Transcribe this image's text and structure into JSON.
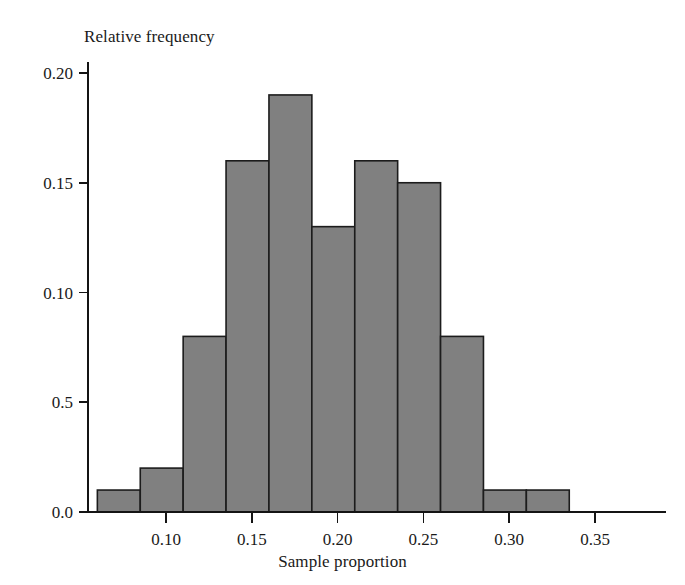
{
  "chart_data": {
    "type": "bar",
    "title": "",
    "xlabel": "Sample proportion",
    "ylabel": "Relative frequency",
    "xlim": [
      0.05,
      0.38
    ],
    "ylim": [
      0.0,
      0.205
    ],
    "grid": false,
    "legend": "none",
    "bin_width": 0.025,
    "bar_fill_color": "#808080",
    "bar_edge_color": "#1c1c1c",
    "axis_color": "#141414",
    "bin_edges": [
      0.06,
      0.085,
      0.11,
      0.135,
      0.16,
      0.185,
      0.21,
      0.235,
      0.26,
      0.285,
      0.31,
      0.335
    ],
    "categories": [
      "0.060-0.085",
      "0.085-0.110",
      "0.110-0.135",
      "0.135-0.160",
      "0.160-0.185",
      "0.185-0.210",
      "0.210-0.235",
      "0.235-0.260",
      "0.260-0.285",
      "0.285-0.310",
      "0.310-0.335"
    ],
    "values": [
      0.01,
      0.02,
      0.08,
      0.16,
      0.19,
      0.13,
      0.16,
      0.15,
      0.08,
      0.01,
      0.01
    ],
    "y_ticks": [
      0.0,
      0.05,
      0.1,
      0.15,
      0.2
    ],
    "y_tick_labels": [
      "0.0",
      "0.5",
      "0.10",
      "0.15",
      "0.20"
    ],
    "x_ticks": [
      0.1,
      0.15,
      0.2,
      0.25,
      0.3,
      0.35
    ],
    "x_tick_labels": [
      "0.10",
      "0.15",
      "0.20",
      "0.25",
      "0.30",
      "0.35"
    ]
  },
  "axis_titles": {
    "y": "Relative frequency",
    "x": "Sample proportion"
  }
}
